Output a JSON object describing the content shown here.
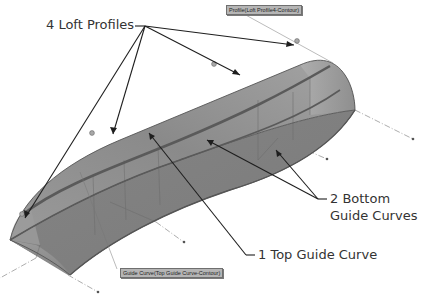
{
  "callouts": {
    "loft_profiles": "4 Loft Profiles",
    "bottom_guides_line1": "2 Bottom",
    "bottom_guides_line2": "Guide Curves",
    "top_guide": "1 Top Guide Curve"
  },
  "tags": {
    "profile": "Profile(Loft Profile4-Contour)",
    "guide": "Guide Curve(Top Guide Curve-Contour)"
  },
  "colors": {
    "surface": "#8e8e8e",
    "surface_dark": "#6e6e6e",
    "edge": "#555555",
    "guide_curve": "#5a5a5a",
    "leader": "#1e1e1e",
    "text": "#333333"
  }
}
